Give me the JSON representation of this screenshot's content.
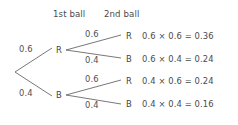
{
  "diagram": {
    "type": "probability-tree",
    "title": "",
    "headers": [
      {
        "label": "1st ball"
      },
      {
        "label": "2nd ball"
      }
    ],
    "level1": [
      {
        "probability": "0.6",
        "outcome": "R"
      },
      {
        "probability": "0.4",
        "outcome": "B"
      }
    ],
    "level2": [
      {
        "probability": "0.6",
        "outcome": "R"
      },
      {
        "probability": "0.4",
        "outcome": "B"
      },
      {
        "probability": "0.6",
        "outcome": "R"
      },
      {
        "probability": "0.4",
        "outcome": "B"
      }
    ],
    "outcomes": [
      {
        "leaf": "R",
        "equation": "0.6 × 0.6 = 0.36"
      },
      {
        "leaf": "B",
        "equation": "0.6 × 0.4 = 0.24"
      },
      {
        "leaf": "R",
        "equation": "0.4 × 0.6 = 0.24"
      },
      {
        "leaf": "B",
        "equation": "0.4 × 0.4 = 0.16"
      }
    ],
    "colors": {
      "background": "#ffffff",
      "line": "#555555",
      "text": "#4a4a4a"
    }
  }
}
